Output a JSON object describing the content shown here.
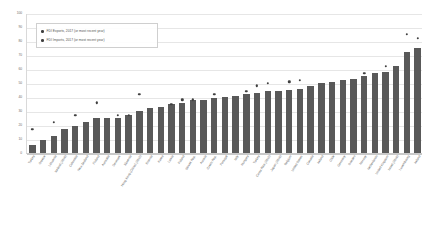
{
  "chart_data": {
    "type": "bar",
    "title": "",
    "xlabel": "",
    "ylabel": "",
    "ylim": [
      0,
      100
    ],
    "yticks": [
      0,
      10,
      20,
      30,
      40,
      50,
      60,
      70,
      80,
      90,
      100
    ],
    "grid": true,
    "legend_position": "top-left",
    "legend": [
      "FDI Exports, 2017 (or most recent year)",
      "FDI Imports, 2017 (or most recent year)"
    ],
    "categories": [
      "Turkey",
      "Greece",
      "Lithuania",
      "Iceland (2016)",
      "Colombia",
      "New Zealand",
      "Finland",
      "Australia",
      "Denmark",
      "Slovenia",
      "Hong Kong (China) (2015)",
      "Estonia",
      "Korea",
      "Latvia",
      "Poland",
      "Slovak Rep.",
      "Austria",
      "Czech Rep.",
      "Portugal",
      "Italy",
      "Hungary",
      "Turkey",
      "Costa Rica (2015)",
      "Japan (2016)",
      "Belgium",
      "United States",
      "Canada",
      "Ireland",
      "Chile",
      "Germany",
      "Sweden",
      "Norway",
      "Netherlands",
      "United Kingdom",
      "Israel (2016)",
      "Luxembourg",
      "Ireland"
    ],
    "series": [
      {
        "name": "FDI Exports, 2017 (or most recent year)",
        "type": "bar",
        "values": [
          6,
          9,
          12,
          17,
          19,
          22,
          25,
          25,
          25,
          27,
          30,
          32,
          33,
          35,
          36,
          38,
          38,
          39,
          40,
          41,
          42,
          43,
          44,
          44,
          45,
          46,
          48,
          50,
          51,
          52,
          53,
          55,
          57,
          58,
          62,
          72,
          75
        ]
      },
      {
        "name": "FDI Imports, 2017 (or most recent year)",
        "type": "scatter",
        "values": [
          17,
          null,
          22,
          null,
          27,
          null,
          36,
          null,
          27,
          27,
          42,
          null,
          null,
          35,
          38,
          38,
          null,
          42,
          null,
          null,
          44,
          48,
          50,
          null,
          51,
          52,
          null,
          null,
          null,
          null,
          null,
          57,
          null,
          62,
          null,
          85,
          82
        ]
      }
    ]
  },
  "axis": {
    "y_tick_labels": [
      "100",
      "90",
      "80",
      "70",
      "60",
      "50",
      "40",
      "30",
      "20",
      "10",
      "0"
    ]
  }
}
